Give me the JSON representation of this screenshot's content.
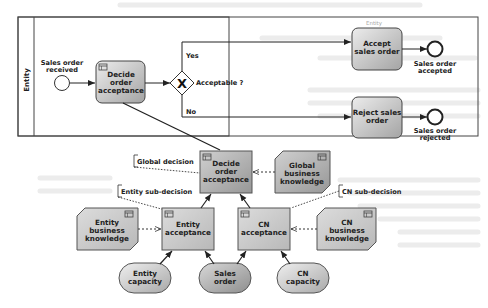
{
  "pool": {
    "lane_label": "Entity",
    "lane_tag": "Entity"
  },
  "process": {
    "start_event": "Sales order received",
    "decide_task": [
      "Decide",
      "order",
      "acceptance"
    ],
    "gateway_label": "Acceptable ?",
    "branch_yes": "Yes",
    "branch_no": "No",
    "accept_task": [
      "Accept",
      "sales order"
    ],
    "reject_task": [
      "Reject sales",
      "order"
    ],
    "end_accepted": [
      "Sales order",
      "accepted"
    ],
    "end_rejected": [
      "Sales order",
      "rejected"
    ]
  },
  "drd": {
    "global_decision_annotation": "Global decision",
    "entity_subdecision_annotation": "Entity sub-decision",
    "cn_subdecision_annotation": "CN sub-decision",
    "decision_main": [
      "Decide",
      "order",
      "acceptance"
    ],
    "global_bkm": [
      "Global",
      "business",
      "knowledge"
    ],
    "entity_bkm": [
      "Entity",
      "business",
      "knowledge"
    ],
    "entity_acceptance": [
      "Entity",
      "acceptance"
    ],
    "cn_acceptance": [
      "CN",
      "acceptance"
    ],
    "cn_bkm": [
      "CN",
      "business",
      "knowledge"
    ],
    "input_entity_capacity": [
      "Entity",
      "capacity"
    ],
    "input_sales_order": [
      "Sales",
      "order"
    ],
    "input_cn_capacity": [
      "CN",
      "capacity"
    ]
  },
  "colors": {
    "task_fill_light": "#e6e6e6",
    "task_fill_dark": "#a9a9a9",
    "stroke": "#333333",
    "lane_border": "#444444"
  }
}
